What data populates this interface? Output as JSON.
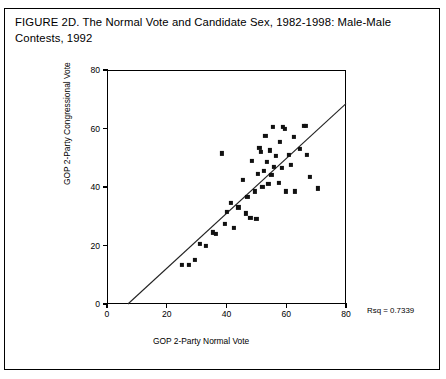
{
  "figure": {
    "title": "FIGURE 2D. The Normal Vote and Candidate Sex, 1982-1998: Male-Male Contests, 1992",
    "rsq_note": "Rsq = 0.7339"
  },
  "chart_data": {
    "type": "scatter",
    "title": "FIGURE 2D. The Normal Vote and Candidate Sex, 1982-1998: Male-Male Contests, 1992",
    "xlabel": "GOP 2-Party Normal Vote",
    "ylabel": "GOP 2-Party Congressional Vote",
    "xlim": [
      0,
      80
    ],
    "ylim": [
      0,
      80
    ],
    "xticks": [
      0,
      20,
      40,
      60,
      80
    ],
    "yticks": [
      0,
      20,
      40,
      60,
      80
    ],
    "xticklabels": [
      "0",
      "20",
      "40",
      "60",
      "80"
    ],
    "yticklabels": [
      "0",
      "20",
      "40",
      "60",
      "80"
    ],
    "grid": false,
    "legend": false,
    "marker": "filled-square",
    "marker_color": "#111111",
    "annotations": [
      {
        "text": "Rsq = 0.7339",
        "x": 86,
        "y": 2
      }
    ],
    "fit_line": {
      "type": "linear-regression",
      "r_squared": 0.7339,
      "x_start": 7.0,
      "y_start": 0.0,
      "x_end": 80.0,
      "y_end": 68.5,
      "slope": 0.938,
      "intercept": -6.57
    },
    "points": [
      {
        "x": 25.0,
        "y": 13.5
      },
      {
        "x": 27.5,
        "y": 13.5
      },
      {
        "x": 29.5,
        "y": 15.0
      },
      {
        "x": 31.0,
        "y": 20.5
      },
      {
        "x": 33.0,
        "y": 20.0
      },
      {
        "x": 35.5,
        "y": 24.5
      },
      {
        "x": 36.5,
        "y": 24.0
      },
      {
        "x": 38.5,
        "y": 51.5
      },
      {
        "x": 39.5,
        "y": 27.5
      },
      {
        "x": 40.0,
        "y": 31.5
      },
      {
        "x": 41.5,
        "y": 34.5
      },
      {
        "x": 42.5,
        "y": 26.0
      },
      {
        "x": 44.0,
        "y": 33.0
      },
      {
        "x": 45.5,
        "y": 42.5
      },
      {
        "x": 46.5,
        "y": 31.0
      },
      {
        "x": 47.0,
        "y": 36.5
      },
      {
        "x": 48.0,
        "y": 29.5
      },
      {
        "x": 48.5,
        "y": 49.0
      },
      {
        "x": 49.5,
        "y": 38.5
      },
      {
        "x": 50.0,
        "y": 29.0
      },
      {
        "x": 50.5,
        "y": 44.5
      },
      {
        "x": 51.0,
        "y": 53.5
      },
      {
        "x": 51.5,
        "y": 52.0
      },
      {
        "x": 52.0,
        "y": 40.0
      },
      {
        "x": 52.5,
        "y": 45.5
      },
      {
        "x": 53.0,
        "y": 57.5
      },
      {
        "x": 53.5,
        "y": 48.5
      },
      {
        "x": 54.0,
        "y": 41.0
      },
      {
        "x": 54.5,
        "y": 52.5
      },
      {
        "x": 55.0,
        "y": 44.0
      },
      {
        "x": 55.5,
        "y": 60.5
      },
      {
        "x": 56.0,
        "y": 47.0
      },
      {
        "x": 56.5,
        "y": 50.5
      },
      {
        "x": 57.5,
        "y": 41.5
      },
      {
        "x": 58.0,
        "y": 55.5
      },
      {
        "x": 58.5,
        "y": 46.5
      },
      {
        "x": 59.0,
        "y": 60.5
      },
      {
        "x": 59.5,
        "y": 60.0
      },
      {
        "x": 60.0,
        "y": 38.5
      },
      {
        "x": 61.0,
        "y": 51.0
      },
      {
        "x": 61.5,
        "y": 47.5
      },
      {
        "x": 62.5,
        "y": 57.0
      },
      {
        "x": 63.0,
        "y": 38.5
      },
      {
        "x": 64.5,
        "y": 53.0
      },
      {
        "x": 66.0,
        "y": 61.0
      },
      {
        "x": 66.5,
        "y": 61.0
      },
      {
        "x": 67.0,
        "y": 51.0
      },
      {
        "x": 68.0,
        "y": 43.5
      },
      {
        "x": 70.5,
        "y": 39.5
      }
    ]
  }
}
